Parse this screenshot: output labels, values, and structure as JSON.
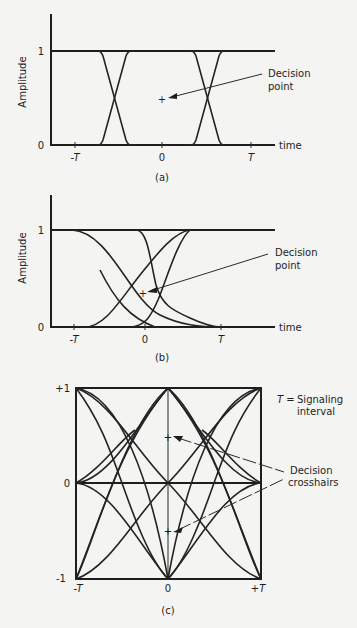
{
  "figure": {
    "panels": [
      {
        "id": "a",
        "caption": "(a)",
        "ylabel": "Amplitude",
        "xlabel": "time",
        "y_ticks": [
          "0",
          "1"
        ],
        "x_ticks": [
          "-T",
          "0",
          "T"
        ],
        "annotation": {
          "line1": "Decision",
          "line2": "point"
        },
        "marker": "+"
      },
      {
        "id": "b",
        "caption": "(b)",
        "ylabel": "Amplitude",
        "xlabel": "time",
        "y_ticks": [
          "0",
          "1"
        ],
        "x_ticks": [
          "-T",
          "0",
          "T"
        ],
        "annotation": {
          "line1": "Decision",
          "line2": "point"
        },
        "marker": "+"
      },
      {
        "id": "c",
        "caption": "(c)",
        "y_ticks": [
          "+1",
          "0",
          "-1"
        ],
        "x_ticks": [
          "-T",
          "0",
          "+T"
        ],
        "legend": {
          "symbol": "T =",
          "line1": "Signaling",
          "line2": "interval"
        },
        "annotation": {
          "line1": "Decision",
          "line2": "crosshairs"
        },
        "marker": "+"
      }
    ]
  }
}
